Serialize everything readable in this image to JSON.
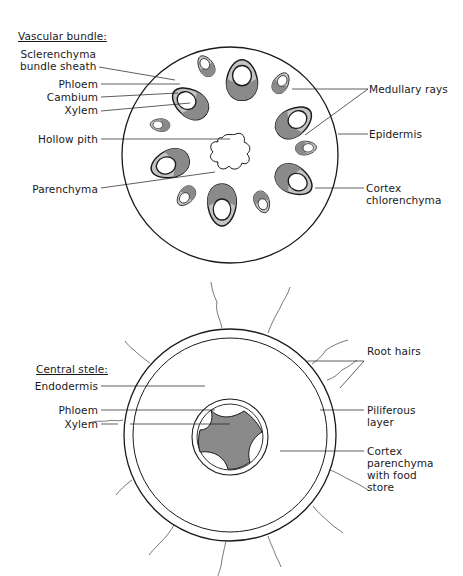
{
  "diagrams": [
    {
      "id": "stem",
      "heading": "Vascular bundle:",
      "labels": {
        "sclerenchyma_line1": "Sclerenchyma",
        "sclerenchyma_line2": "bundle sheath",
        "phloem": "Phloem",
        "cambium": "Cambium",
        "xylem": "Xylem",
        "hollow_pith": "Hollow pith",
        "parenchyma": "Parenchyma",
        "medullary_rays": "Medullary rays",
        "epidermis": "Epidermis",
        "cortex_line1": "Cortex",
        "cortex_line2": "chlorenchyma"
      }
    },
    {
      "id": "root",
      "heading": "Central stele:",
      "labels": {
        "endodermis": "Endodermis",
        "phloem": "Phloem",
        "xylem": "Xylem",
        "root_hairs": "Root hairs",
        "piliferous_line1": "Piliferous",
        "piliferous_line2": "layer",
        "cortex_line1": "Cortex",
        "cortex_line2": "parenchyma",
        "cortex_line3": "with food",
        "cortex_line4": "store"
      }
    }
  ],
  "colors": {
    "ink": "#1a1a1a",
    "xylem_fill": "#8a8a8a",
    "phloem_fill": "#c4c4c4",
    "paper": "#ffffff"
  }
}
